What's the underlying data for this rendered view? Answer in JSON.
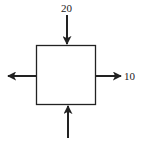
{
  "diagram": {
    "type": "force-diagram",
    "colors": {
      "stroke": "#222222",
      "background": "#ffffff"
    },
    "element": {
      "shape": "square",
      "x": 36,
      "y": 45,
      "width": 60,
      "height": 60
    },
    "arrows": [
      {
        "id": "top",
        "direction": "down",
        "from": [
          67,
          15
        ],
        "to": [
          67,
          45
        ],
        "label": "20"
      },
      {
        "id": "right",
        "direction": "right",
        "from": [
          96,
          76
        ],
        "to": [
          121,
          76
        ],
        "label": "10"
      },
      {
        "id": "left",
        "direction": "left",
        "from": [
          36,
          76
        ],
        "to": [
          8,
          76
        ],
        "label": ""
      },
      {
        "id": "bottom",
        "direction": "up",
        "from": [
          68,
          138
        ],
        "to": [
          68,
          105
        ],
        "label": ""
      }
    ]
  },
  "labels": {
    "top": "20",
    "right": "10"
  }
}
